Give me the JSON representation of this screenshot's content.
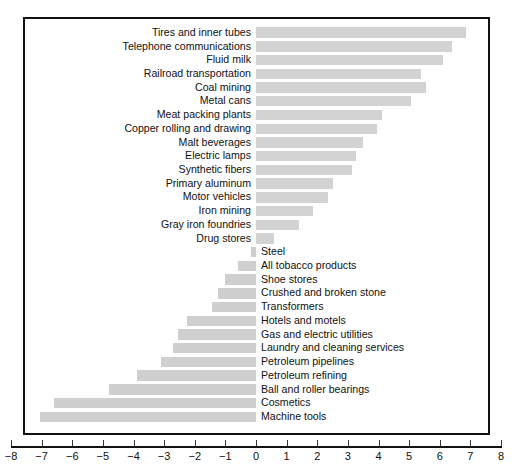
{
  "chart_data": {
    "type": "bar",
    "orientation": "horizontal",
    "title": "",
    "subtitle": "",
    "xlabel": "",
    "ylabel": "",
    "xlim": [
      -8,
      8
    ],
    "xticks": [
      "-8",
      "-7",
      "-6",
      "-5",
      "-4",
      "-3",
      "-2",
      "-1",
      "0",
      "1",
      "2",
      "3",
      "4",
      "5",
      "6",
      "7",
      "8"
    ],
    "xtick_values": [
      -8,
      -7,
      -6,
      -5,
      -4,
      -3,
      -2,
      -1,
      0,
      1,
      2,
      3,
      4,
      5,
      6,
      7,
      8
    ],
    "grid": false,
    "legend": null,
    "bar_color": "#d3d3d3",
    "frame_color": "#111111",
    "categories": [
      "Tires and inner tubes",
      "Telephone communications",
      "Fluid milk",
      "Railroad transportation",
      "Coal mining",
      "Metal cans",
      "Meat packing plants",
      "Copper rolling and drawing",
      "Malt beverages",
      "Electric lamps",
      "Synthetic fibers",
      "Primary aluminum",
      "Motor vehicles",
      "Iron mining",
      "Gray iron foundries",
      "Drug stores",
      "Steel",
      "All tobacco products",
      "Shoe stores",
      "Crushed and broken stone",
      "Transformers",
      "Hotels and motels",
      "Gas and electric utilities",
      "Laundry and cleaning services",
      "Petroleum pipelines",
      "Petroleum refining",
      "Ball and roller bearings",
      "Cosmetics",
      "Machine tools"
    ],
    "values": [
      6.85,
      6.4,
      6.1,
      5.4,
      5.55,
      5.05,
      4.1,
      3.95,
      3.5,
      3.25,
      3.15,
      2.5,
      2.35,
      1.85,
      1.4,
      0.6,
      -0.15,
      -0.6,
      -1.0,
      -1.25,
      -1.45,
      -2.25,
      -2.55,
      -2.7,
      -3.1,
      -3.9,
      -4.8,
      -6.6,
      -7.05
    ]
  }
}
